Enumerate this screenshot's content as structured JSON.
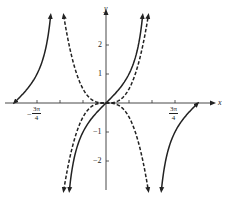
{
  "chart_data": {
    "type": "line",
    "title": "",
    "xlabel": "x",
    "ylabel": "y",
    "xlim": [
      -3.3,
      3.3
    ],
    "ylim": [
      -3,
      3
    ],
    "grid": false,
    "legend": null,
    "x_ticks_count_per_side": 3,
    "x_tick_step": "π/4",
    "x_tick_labels": [
      {
        "value": -2.356,
        "label_num": "3π",
        "label_den": "4",
        "sign": "−"
      },
      {
        "value": 2.356,
        "label_num": "3π",
        "label_den": "4",
        "sign": ""
      }
    ],
    "y_tick_labels": [
      {
        "value": 2,
        "label": "2"
      },
      {
        "value": 1,
        "label": "1"
      },
      {
        "value": -1,
        "label": "−1"
      },
      {
        "value": -2,
        "label": "−2"
      }
    ],
    "series": [
      {
        "name": "tan x",
        "style": "solid",
        "description": "y = tan x, branches with asymptotes at ±π/2, arrows at ends"
      },
      {
        "name": "curve A",
        "style": "dashed",
        "description": "increasing cubic-like curve through origin"
      },
      {
        "name": "curve B",
        "style": "dashed",
        "description": "decreasing cubic-like curve through origin"
      }
    ],
    "sample_points": {
      "tan_x": [
        [
          -0.785,
          -1
        ],
        [
          0,
          0
        ],
        [
          0.785,
          1
        ],
        [
          1.2,
          2.57
        ]
      ],
      "dashed_inc": [
        [
          -1,
          -1
        ],
        [
          0,
          0
        ],
        [
          1,
          1
        ],
        [
          1.4,
          2.74
        ]
      ],
      "dashed_dec": [
        [
          -1,
          1
        ],
        [
          0,
          0
        ],
        [
          1,
          -1
        ],
        [
          1.4,
          -2.74
        ]
      ]
    }
  },
  "labels": {
    "x_axis": "x",
    "y_axis": "y",
    "neg_sign": "−",
    "three_pi": "3π",
    "four": "4",
    "y2": "2",
    "y1": "1",
    "ym1": "−1",
    "ym2": "−2"
  }
}
